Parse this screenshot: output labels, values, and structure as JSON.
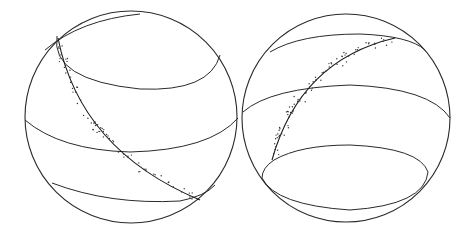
{
  "figure": {
    "colors": {
      "stroke": "#2a2a2a",
      "points": "#333333",
      "background": "#ffffff"
    },
    "spheres": [
      {
        "id": "left",
        "center": [
          131,
          117
        ],
        "radius": 106,
        "rings": [
          {
            "cy": 62,
            "rx": 92,
            "ry": 26,
            "note": "upper cap ring"
          },
          {
            "cy": 128,
            "rx": 106,
            "ry": 24,
            "note": "equatorial ring"
          },
          {
            "cy": 190,
            "rx": 90,
            "ry": 16,
            "note": "lower ring"
          }
        ],
        "great_circle": "M 62 32 Q 90 150 195 198",
        "points_count": 70
      },
      {
        "id": "right",
        "center": [
          346,
          118
        ],
        "radius": 104,
        "rings": [
          {
            "cy": 50,
            "rx": 88,
            "ry": 16,
            "note": "upper ring"
          },
          {
            "cy": 110,
            "rx": 103,
            "ry": 26,
            "note": "middle ring"
          },
          {
            "cy": 172,
            "rx": 90,
            "ry": 28,
            "note": "lower cap ring"
          }
        ],
        "great_circle": "M 272 150 Q 300 60 395 38",
        "points_count": 80
      }
    ]
  }
}
